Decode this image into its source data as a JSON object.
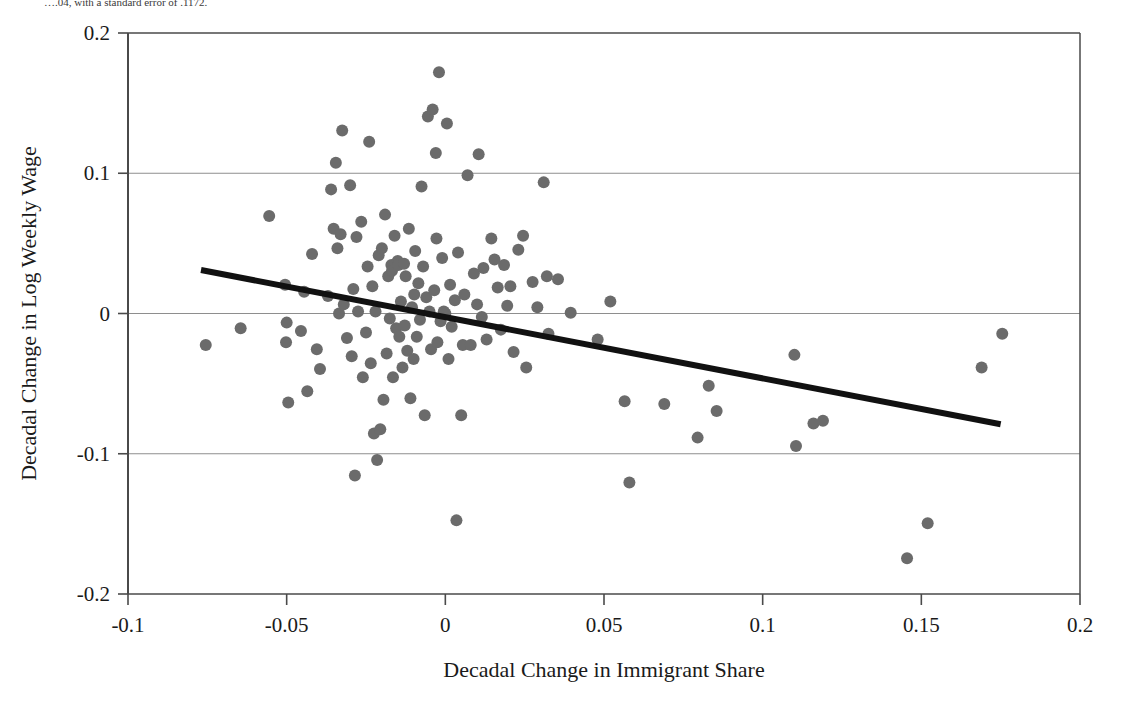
{
  "caption_fragment": "….04, with a standard error of .1172.",
  "chart_data": {
    "type": "scatter",
    "title": "",
    "xlabel": "Decadal Change in Immigrant Share",
    "ylabel": "Decadal Change in Log Weekly Wage",
    "xlim": [
      -0.1,
      0.2
    ],
    "ylim": [
      -0.2,
      0.2
    ],
    "xticks": [
      -0.1,
      -0.05,
      0,
      0.05,
      0.1,
      0.15,
      0.2
    ],
    "xtick_labels": [
      "-0.1",
      "-0.05",
      "0",
      "0.05",
      "0.1",
      "0.15",
      "0.2"
    ],
    "yticks": [
      -0.2,
      -0.1,
      0,
      0.1,
      0.2
    ],
    "ytick_labels": [
      "-0.2",
      "-0.1",
      "0",
      "0.1",
      "0.2"
    ],
    "gridlines_y": [
      0.1,
      0,
      -0.1
    ],
    "grid": true,
    "legend": null,
    "marker_color": "#6b6b6b",
    "marker_radius_px": 6,
    "line_color": "#111111",
    "fit_line": {
      "label": "regression line",
      "x_start": -0.077,
      "y_start": 0.031,
      "x_end": 0.175,
      "y_end": -0.079
    },
    "points": [
      [
        -0.0755,
        -0.0225
      ],
      [
        -0.0645,
        -0.0105
      ],
      [
        -0.0555,
        0.0695
      ],
      [
        -0.0505,
        0.0205
      ],
      [
        -0.0502,
        -0.0205
      ],
      [
        -0.05,
        -0.0065
      ],
      [
        -0.0495,
        -0.0635
      ],
      [
        -0.0455,
        -0.0125
      ],
      [
        -0.0445,
        0.0155
      ],
      [
        -0.0435,
        -0.0555
      ],
      [
        -0.042,
        0.0425
      ],
      [
        -0.0405,
        -0.0255
      ],
      [
        -0.0395,
        -0.0395
      ],
      [
        -0.037,
        0.0125
      ],
      [
        -0.036,
        0.0885
      ],
      [
        -0.0352,
        0.0605
      ],
      [
        -0.0345,
        0.1075
      ],
      [
        -0.034,
        0.0465
      ],
      [
        -0.0335,
        0.0
      ],
      [
        -0.033,
        0.0565
      ],
      [
        -0.0325,
        0.1305
      ],
      [
        -0.032,
        0.0065
      ],
      [
        -0.031,
        -0.0175
      ],
      [
        -0.03,
        0.0915
      ],
      [
        -0.0295,
        -0.0305
      ],
      [
        -0.029,
        0.0175
      ],
      [
        -0.0285,
        -0.1155
      ],
      [
        -0.028,
        0.0545
      ],
      [
        -0.0275,
        0.0015
      ],
      [
        -0.0265,
        0.0655
      ],
      [
        -0.026,
        -0.0455
      ],
      [
        -0.025,
        -0.0135
      ],
      [
        -0.0245,
        0.0335
      ],
      [
        -0.024,
        0.1225
      ],
      [
        -0.0235,
        -0.0355
      ],
      [
        -0.023,
        0.0195
      ],
      [
        -0.0225,
        -0.0855
      ],
      [
        -0.022,
        0.0015
      ],
      [
        -0.0215,
        -0.1045
      ],
      [
        -0.021,
        0.0415
      ],
      [
        -0.0205,
        -0.0825
      ],
      [
        -0.02,
        0.0465
      ],
      [
        -0.0195,
        -0.0615
      ],
      [
        -0.019,
        0.0705
      ],
      [
        -0.0185,
        -0.0285
      ],
      [
        -0.018,
        0.0265
      ],
      [
        -0.0175,
        -0.0035
      ],
      [
        -0.017,
        0.0345
      ],
      [
        -0.0168,
        0.0305
      ],
      [
        -0.0165,
        -0.0455
      ],
      [
        -0.016,
        0.0555
      ],
      [
        -0.0155,
        -0.0105
      ],
      [
        -0.015,
        0.0375
      ],
      [
        -0.0148,
        0.0345
      ],
      [
        -0.0145,
        -0.0165
      ],
      [
        -0.014,
        0.0085
      ],
      [
        -0.0135,
        -0.0385
      ],
      [
        -0.013,
        0.0355
      ],
      [
        -0.0128,
        -0.0085
      ],
      [
        -0.0125,
        0.0265
      ],
      [
        -0.012,
        -0.0265
      ],
      [
        -0.0115,
        0.0605
      ],
      [
        -0.011,
        -0.0605
      ],
      [
        -0.0105,
        0.0045
      ],
      [
        -0.01,
        -0.0325
      ],
      [
        -0.0098,
        0.0135
      ],
      [
        -0.0095,
        0.0445
      ],
      [
        -0.009,
        -0.0165
      ],
      [
        -0.0085,
        0.0215
      ],
      [
        -0.008,
        -0.0045
      ],
      [
        -0.0075,
        0.0905
      ],
      [
        -0.007,
        0.0335
      ],
      [
        -0.0065,
        -0.0725
      ],
      [
        -0.006,
        0.0115
      ],
      [
        -0.0055,
        0.1405
      ],
      [
        -0.005,
        0.0015
      ],
      [
        -0.0045,
        -0.0255
      ],
      [
        -0.004,
        0.1455
      ],
      [
        -0.0035,
        0.0165
      ],
      [
        -0.003,
        0.1145
      ],
      [
        -0.0028,
        0.0535
      ],
      [
        -0.0025,
        -0.0205
      ],
      [
        -0.002,
        0.172
      ],
      [
        -0.0015,
        -0.0055
      ],
      [
        -0.001,
        0.0395
      ],
      [
        -0.0005,
        0.0015
      ],
      [
        0.0,
        0.0
      ],
      [
        0.0005,
        0.1355
      ],
      [
        0.001,
        -0.0325
      ],
      [
        0.0015,
        0.0205
      ],
      [
        0.002,
        -0.0095
      ],
      [
        0.003,
        0.0095
      ],
      [
        0.0035,
        -0.1475
      ],
      [
        0.004,
        0.0435
      ],
      [
        0.005,
        -0.0725
      ],
      [
        0.0055,
        -0.0225
      ],
      [
        0.006,
        0.0135
      ],
      [
        0.007,
        0.0985
      ],
      [
        0.008,
        -0.0225
      ],
      [
        0.009,
        0.0285
      ],
      [
        0.01,
        0.0065
      ],
      [
        0.0105,
        0.1135
      ],
      [
        0.0115,
        -0.0025
      ],
      [
        0.012,
        0.0325
      ],
      [
        0.013,
        -0.0185
      ],
      [
        0.0145,
        0.0535
      ],
      [
        0.0155,
        0.0385
      ],
      [
        0.0165,
        0.0185
      ],
      [
        0.0175,
        -0.0115
      ],
      [
        0.0185,
        0.0345
      ],
      [
        0.0195,
        0.0055
      ],
      [
        0.0205,
        0.0195
      ],
      [
        0.0215,
        -0.0275
      ],
      [
        0.023,
        0.0455
      ],
      [
        0.0245,
        0.0555
      ],
      [
        0.0255,
        -0.0385
      ],
      [
        0.0275,
        0.0225
      ],
      [
        0.029,
        0.0045
      ],
      [
        0.031,
        0.0935
      ],
      [
        0.032,
        0.0265
      ],
      [
        0.0325,
        -0.0145
      ],
      [
        0.0355,
        0.0245
      ],
      [
        0.0395,
        0.0005
      ],
      [
        0.048,
        -0.0185
      ],
      [
        0.052,
        0.0085
      ],
      [
        0.0565,
        -0.0625
      ],
      [
        0.058,
        -0.1205
      ],
      [
        0.069,
        -0.0645
      ],
      [
        0.0795,
        -0.0885
      ],
      [
        0.083,
        -0.0515
      ],
      [
        0.0855,
        -0.0695
      ],
      [
        0.11,
        -0.0295
      ],
      [
        0.1105,
        -0.0945
      ],
      [
        0.116,
        -0.0785
      ],
      [
        0.119,
        -0.0765
      ],
      [
        0.1455,
        -0.1745
      ],
      [
        0.152,
        -0.1495
      ],
      [
        0.169,
        -0.0385
      ],
      [
        0.1755,
        -0.0145
      ]
    ]
  }
}
